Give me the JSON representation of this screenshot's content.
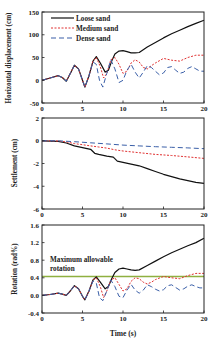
{
  "chart_data": [
    {
      "type": "line",
      "title": "",
      "xlabel": "",
      "ylabel": "Horizontal displacement (cm)",
      "xlim": [
        0,
        20
      ],
      "ylim": [
        -50,
        150
      ],
      "xticks": [
        0,
        5,
        10,
        15,
        20
      ],
      "yticks": [
        -50,
        0,
        50,
        100,
        150
      ],
      "grid": false,
      "legend_position": "upper left",
      "series": [
        {
          "name": "Loose sand",
          "color": "#111111",
          "dash": "",
          "x": [
            0,
            1,
            2,
            2.5,
            3,
            3.5,
            4,
            4.5,
            5,
            5.3,
            5.8,
            6.3,
            6.7,
            7.2,
            7.8,
            8.2,
            8.6,
            9,
            9.5,
            10,
            10.5,
            11,
            11.5,
            12,
            13,
            14,
            15,
            16,
            17,
            18,
            19,
            20
          ],
          "y": [
            0,
            5,
            10,
            6,
            -2,
            15,
            33,
            25,
            0,
            -15,
            10,
            42,
            52,
            38,
            18,
            22,
            42,
            58,
            64,
            65,
            63,
            60,
            60,
            61,
            73,
            83,
            93,
            102,
            110,
            118,
            125,
            132
          ]
        },
        {
          "name": "Medium sand",
          "color": "#e03030",
          "dash": "2,1.5",
          "x": [
            0,
            1,
            2,
            2.5,
            3,
            3.5,
            4,
            4.5,
            5,
            5.3,
            5.8,
            6.3,
            6.7,
            7.2,
            7.6,
            8,
            8.5,
            9,
            9.5,
            10,
            10.5,
            11,
            11.5,
            12,
            12.5,
            13,
            13.5,
            14,
            15,
            16,
            17,
            18,
            19,
            20
          ],
          "y": [
            0,
            5,
            10,
            6,
            -2,
            15,
            33,
            25,
            0,
            -15,
            10,
            42,
            50,
            30,
            5,
            15,
            45,
            50,
            35,
            15,
            20,
            38,
            45,
            40,
            28,
            25,
            32,
            38,
            48,
            44,
            42,
            50,
            55,
            55
          ]
        },
        {
          "name": "Dense sand",
          "color": "#3a5fa8",
          "dash": "5,3",
          "x": [
            0,
            1,
            2,
            2.5,
            3,
            3.5,
            4,
            4.5,
            5,
            5.3,
            5.8,
            6.3,
            6.7,
            7.1,
            7.5,
            8,
            8.5,
            9,
            9.5,
            10,
            10.5,
            11,
            11.5,
            12,
            12.5,
            13,
            13.5,
            14,
            14.5,
            15,
            15.5,
            16,
            16.5,
            17,
            17.5,
            18,
            18.5,
            19,
            19.5,
            20
          ],
          "y": [
            0,
            5,
            10,
            6,
            -2,
            15,
            33,
            25,
            0,
            -15,
            10,
            40,
            35,
            0,
            -15,
            15,
            45,
            25,
            -5,
            0,
            22,
            35,
            18,
            5,
            18,
            32,
            28,
            20,
            12,
            16,
            28,
            30,
            22,
            15,
            18,
            26,
            30,
            25,
            20,
            20
          ]
        }
      ]
    },
    {
      "type": "line",
      "title": "",
      "xlabel": "",
      "ylabel": "Settlement (cm)",
      "xlim": [
        0,
        20
      ],
      "ylim": [
        -6,
        2
      ],
      "xticks": [
        0,
        5,
        10,
        15,
        20
      ],
      "yticks": [
        -6,
        -4,
        -2,
        0,
        2
      ],
      "grid": false,
      "series": [
        {
          "name": "Loose sand",
          "color": "#111111",
          "dash": "",
          "x": [
            0,
            2,
            3,
            4,
            5,
            6,
            6.5,
            7,
            8,
            8.8,
            9.3,
            10,
            11,
            12,
            13,
            14,
            15,
            16,
            17,
            18,
            19,
            20
          ],
          "y": [
            0,
            -0.05,
            -0.2,
            -0.45,
            -0.6,
            -0.75,
            -1.1,
            -1.2,
            -1.35,
            -1.45,
            -1.8,
            -1.9,
            -2.05,
            -2.2,
            -2.45,
            -2.7,
            -2.95,
            -3.15,
            -3.35,
            -3.5,
            -3.65,
            -3.75
          ]
        },
        {
          "name": "Medium sand",
          "color": "#e03030",
          "dash": "2,1.5",
          "x": [
            0,
            2,
            3,
            4,
            5,
            6,
            7,
            8,
            9,
            10,
            12,
            14,
            16,
            18,
            20
          ],
          "y": [
            0,
            -0.02,
            -0.1,
            -0.25,
            -0.35,
            -0.45,
            -0.55,
            -0.65,
            -0.8,
            -0.9,
            -1.05,
            -1.2,
            -1.3,
            -1.42,
            -1.55
          ]
        },
        {
          "name": "Dense sand",
          "color": "#3a5fa8",
          "dash": "5,3",
          "x": [
            0,
            2,
            4,
            6,
            8,
            10,
            12,
            14,
            16,
            18,
            20
          ],
          "y": [
            0,
            0,
            -0.08,
            -0.18,
            -0.28,
            -0.38,
            -0.45,
            -0.52,
            -0.58,
            -0.63,
            -0.7
          ]
        }
      ]
    },
    {
      "type": "line",
      "title": "",
      "xlabel": "Time (s)",
      "ylabel": "Rotation (rad%)",
      "xlim": [
        0,
        20
      ],
      "ylim": [
        -0.4,
        1.6
      ],
      "xticks": [
        0,
        5,
        10,
        15,
        20
      ],
      "yticks": [
        -0.4,
        0.0,
        0.4,
        0.8,
        1.2,
        1.6
      ],
      "ytick_labels": [
        "-0.4",
        "0.0",
        "0.4",
        "0.8",
        "1.2",
        "1.6"
      ],
      "grid": false,
      "annotations": [
        {
          "text_lines": [
            "Maximum allowable",
            "rotation"
          ],
          "x": 0.8,
          "y": 0.74
        }
      ],
      "reference_lines": [
        {
          "name": "Maximum allowable rotation",
          "y": 0.43,
          "color": "#8fb040"
        }
      ],
      "series": [
        {
          "name": "Loose sand",
          "color": "#111111",
          "dash": "",
          "x": [
            0,
            1,
            2,
            2.5,
            3,
            3.5,
            4,
            4.5,
            5,
            5.3,
            5.8,
            6.3,
            6.7,
            7.2,
            7.8,
            8.2,
            8.6,
            9,
            9.5,
            10,
            10.5,
            11,
            11.5,
            12,
            13,
            14,
            15,
            16,
            17,
            18,
            19,
            20
          ],
          "y": [
            0,
            0.02,
            0.05,
            0.03,
            0.0,
            0.1,
            0.22,
            0.15,
            -0.02,
            -0.1,
            0.1,
            0.35,
            0.42,
            0.3,
            0.15,
            0.2,
            0.38,
            0.52,
            0.6,
            0.62,
            0.6,
            0.58,
            0.57,
            0.58,
            0.68,
            0.78,
            0.88,
            0.97,
            1.05,
            1.13,
            1.2,
            1.3
          ]
        },
        {
          "name": "Medium sand",
          "color": "#e03030",
          "dash": "2,1.5",
          "x": [
            0,
            1,
            2,
            2.5,
            3,
            3.5,
            4,
            4.5,
            5,
            5.3,
            5.8,
            6.3,
            6.7,
            7.2,
            7.6,
            8,
            8.5,
            9,
            9.5,
            10,
            10.5,
            11,
            11.5,
            12,
            12.5,
            13,
            13.5,
            14,
            15,
            16,
            17,
            18,
            19,
            20
          ],
          "y": [
            0,
            0.02,
            0.05,
            0.03,
            0.0,
            0.1,
            0.22,
            0.15,
            -0.02,
            -0.1,
            0.1,
            0.35,
            0.4,
            0.2,
            -0.05,
            0.1,
            0.35,
            0.4,
            0.25,
            0.1,
            0.15,
            0.32,
            0.4,
            0.38,
            0.3,
            0.26,
            0.3,
            0.36,
            0.43,
            0.4,
            0.38,
            0.45,
            0.5,
            0.5
          ]
        },
        {
          "name": "Dense sand",
          "color": "#3a5fa8",
          "dash": "5,3",
          "x": [
            0,
            1,
            2,
            2.5,
            3,
            3.5,
            4,
            4.5,
            5,
            5.3,
            5.8,
            6.3,
            6.7,
            7.1,
            7.5,
            8,
            8.5,
            9,
            9.5,
            10,
            10.5,
            11,
            11.5,
            12,
            12.5,
            13,
            13.5,
            14,
            14.5,
            15,
            15.5,
            16,
            16.5,
            17,
            17.5,
            18,
            18.5,
            19,
            19.5,
            20
          ],
          "y": [
            0,
            0.02,
            0.05,
            0.03,
            0.0,
            0.1,
            0.22,
            0.15,
            -0.02,
            -0.1,
            0.1,
            0.33,
            0.28,
            -0.05,
            -0.12,
            0.1,
            0.35,
            0.2,
            -0.02,
            -0.05,
            0.12,
            0.25,
            0.12,
            0.05,
            0.12,
            0.24,
            0.2,
            0.14,
            0.1,
            0.13,
            0.22,
            0.24,
            0.18,
            0.12,
            0.15,
            0.21,
            0.24,
            0.2,
            0.17,
            0.17
          ]
        }
      ]
    }
  ],
  "legend": {
    "items": [
      "Loose sand",
      "Medium sand",
      "Dense sand"
    ]
  },
  "labels": {
    "panel1_ylabel": "Horizontal displacement (cm)",
    "panel2_ylabel": "Settlement (cm)",
    "panel3_ylabel": "Rotation (rad%)",
    "xlabel": "Time (s)",
    "annotation_line1": "Maximum allowable",
    "annotation_line2": "rotation"
  }
}
